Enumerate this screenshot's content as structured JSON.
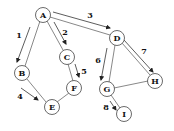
{
  "diagram": {
    "type": "graph-traversal",
    "nodes": [
      {
        "id": "A",
        "label": "A",
        "x": 43,
        "y": 15
      },
      {
        "id": "B",
        "label": "B",
        "x": 22,
        "y": 73
      },
      {
        "id": "C",
        "label": "C",
        "x": 67,
        "y": 57
      },
      {
        "id": "D",
        "label": "D",
        "x": 117,
        "y": 38
      },
      {
        "id": "E",
        "label": "E",
        "x": 52,
        "y": 107
      },
      {
        "id": "F",
        "label": "F",
        "x": 74,
        "y": 88
      },
      {
        "id": "G",
        "label": "G",
        "x": 107,
        "y": 89
      },
      {
        "id": "H",
        "label": "H",
        "x": 155,
        "y": 81
      },
      {
        "id": "I",
        "label": "I",
        "x": 124,
        "y": 114
      }
    ],
    "edges": [
      {
        "from": "A",
        "to": "B"
      },
      {
        "from": "A",
        "to": "C"
      },
      {
        "from": "A",
        "to": "D"
      },
      {
        "from": "B",
        "to": "E"
      },
      {
        "from": "C",
        "to": "F"
      },
      {
        "from": "E",
        "to": "F"
      },
      {
        "from": "D",
        "to": "G"
      },
      {
        "from": "D",
        "to": "H"
      },
      {
        "from": "G",
        "to": "H"
      },
      {
        "from": "G",
        "to": "I"
      }
    ],
    "traversal_arrows": [
      {
        "order": "1",
        "from": "A",
        "to": "B"
      },
      {
        "order": "2",
        "from": "A",
        "to": "C"
      },
      {
        "order": "3",
        "from": "A",
        "to": "D"
      },
      {
        "order": "4",
        "from": "B",
        "to": "E"
      },
      {
        "order": "5",
        "from": "C",
        "to": "F"
      },
      {
        "order": "6",
        "from": "D",
        "to": "G"
      },
      {
        "order": "7",
        "from": "D",
        "to": "H"
      },
      {
        "order": "8",
        "from": "G",
        "to": "I"
      }
    ]
  },
  "labels": {
    "node_A": "A",
    "node_B": "B",
    "node_C": "C",
    "node_D": "D",
    "node_E": "E",
    "node_F": "F",
    "node_G": "G",
    "node_H": "H",
    "node_I": "I",
    "order_1": "1",
    "order_2": "2",
    "order_3": "3",
    "order_4": "4",
    "order_5": "5",
    "order_6": "6",
    "order_7": "7",
    "order_8": "8"
  }
}
